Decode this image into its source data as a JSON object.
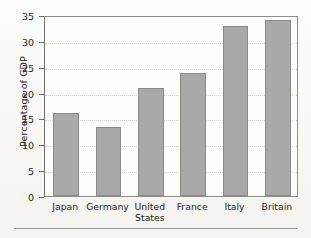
{
  "chart_data": {
    "type": "bar",
    "title": "",
    "subtitle": "",
    "xlabel": "",
    "ylabel": "Percentage of GDP",
    "categories": [
      "Japan",
      "Germany",
      "United States",
      "France",
      "Italy",
      "Britain"
    ],
    "values": [
      16.0,
      13.4,
      20.8,
      23.8,
      32.9,
      34.1
    ],
    "series": [
      {
        "name": "Percentage of GDP",
        "values": [
          16.0,
          13.4,
          20.8,
          23.8,
          32.9,
          34.1
        ]
      }
    ],
    "ylim": [
      0,
      35
    ],
    "ytick_labels": [
      "0",
      "5",
      "10",
      "15",
      "20",
      "25",
      "30",
      "35"
    ],
    "ytick_values": [
      0,
      5,
      10,
      15,
      20,
      25,
      30,
      35
    ],
    "grid": "horizontal-dotted",
    "legend": "none",
    "bar_color": "#a9a9a9",
    "bar_border_color": "#8a8a8a",
    "axis_color": "#6f6f6f",
    "grid_color": "#d8d8d6",
    "background_color": "#fdfdfc",
    "annotations": []
  },
  "figure": {
    "category_label_lines": [
      [
        "Japan"
      ],
      [
        "Germany"
      ],
      [
        "United",
        "States"
      ],
      [
        "France"
      ],
      [
        "Italy"
      ],
      [
        "Britain"
      ]
    ]
  }
}
